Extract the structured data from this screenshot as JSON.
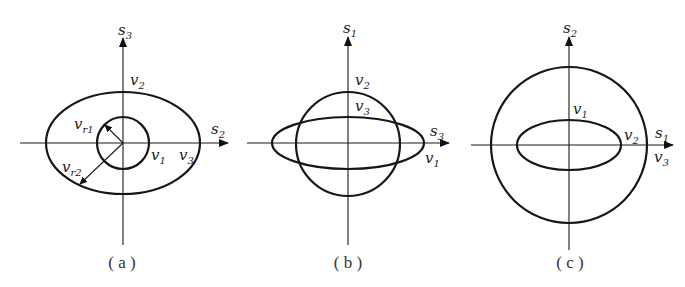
{
  "figure": {
    "panels": [
      {
        "id": "a",
        "caption": "( a )",
        "vertical_axis": {
          "symbol": "s",
          "index": "3"
        },
        "horizontal_axis": {
          "symbol": "s",
          "index": "2"
        },
        "shapes": [
          {
            "type": "ellipse",
            "label": "v2 / v3 surface",
            "rx": 77,
            "ry": 51
          },
          {
            "type": "circle",
            "label": "v1 surface",
            "r": 26
          }
        ],
        "labels": {
          "top": {
            "symbol": "v",
            "index": "2"
          },
          "inner_right": {
            "symbol": "v",
            "index": "1"
          },
          "outer_right": {
            "symbol": "v",
            "index": "3"
          },
          "radius_inner": {
            "symbol": "v",
            "index": "r1"
          },
          "radius_outer": {
            "symbol": "v",
            "index": "r2"
          }
        }
      },
      {
        "id": "b",
        "caption": "( b )",
        "vertical_axis": {
          "symbol": "s",
          "index": "1"
        },
        "horizontal_axis": {
          "symbol": "s",
          "index": "3"
        },
        "shapes": [
          {
            "type": "circle",
            "r": 51
          },
          {
            "type": "ellipse",
            "rx": 76,
            "ry": 26
          }
        ],
        "labels": {
          "top": {
            "symbol": "v",
            "index": "2"
          },
          "inner_top": {
            "symbol": "v",
            "index": "3"
          },
          "right": {
            "symbol": "v",
            "index": "1"
          }
        }
      },
      {
        "id": "c",
        "caption": "( c )",
        "vertical_axis": {
          "symbol": "s",
          "index": "2"
        },
        "horizontal_axis": {
          "symbol": "s",
          "index": "1"
        },
        "shapes": [
          {
            "type": "circle",
            "r": 78
          },
          {
            "type": "ellipse",
            "rx": 52,
            "ry": 25
          }
        ],
        "labels": {
          "inner_top": {
            "symbol": "v",
            "index": "1"
          },
          "inner_right": {
            "symbol": "v",
            "index": "2"
          },
          "outer_right": {
            "symbol": "v",
            "index": "3"
          }
        }
      }
    ]
  }
}
